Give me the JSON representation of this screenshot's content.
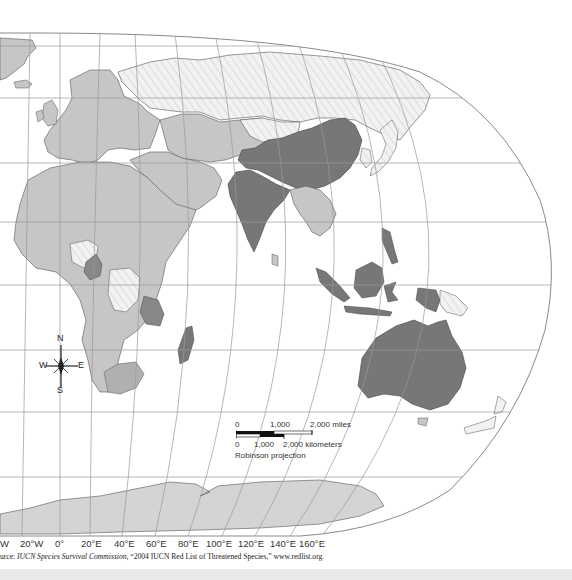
{
  "map": {
    "projection_label": "Robinson projection",
    "palette": {
      "high": "#777777",
      "medium": "#c6c6c6",
      "low_hatch_bg": "#f2f2f2",
      "low_hatch_line": "#dedede",
      "ocean": "#ffffff",
      "border": "#555555",
      "grid": "#9a9a9a",
      "antarctica": "#d4d4d4"
    },
    "longitude_labels": [
      "W",
      "20°W",
      "0°",
      "20°E",
      "40°E",
      "60°E",
      "80°E",
      "100°E",
      "120°E",
      "140°E",
      "160°E"
    ],
    "compass": {
      "n": "N",
      "s": "S",
      "e": "E",
      "w": "W"
    },
    "scale_bar": {
      "miles_labels": [
        "0",
        "1,000",
        "2,000 miles"
      ],
      "km_labels": [
        "0",
        "1,000",
        "2,000 kilometers"
      ]
    },
    "dark_regions": [
      "China",
      "India",
      "Indonesia",
      "Malaysia",
      "Philippines",
      "Papua New Guinea (west)",
      "Australia",
      "Madagascar",
      "Tanzania",
      "Cameroon"
    ],
    "medium_regions": [
      "Europe",
      "Middle East",
      "Central Asia",
      "North Africa",
      "Sub-Saharan Africa",
      "South Africa",
      "Southeast Asia mainland",
      "Greenland"
    ],
    "hatched_regions": [
      "Russia",
      "Mongolia",
      "Nigeria",
      "DR Congo",
      "Japan/Korea region"
    ]
  },
  "source": {
    "prefix": "urce: ",
    "org": "IUCN Species Survival Commission,",
    "rest": " “2004 IUCN Red List of Threatened Species,” www.redlist.org."
  }
}
